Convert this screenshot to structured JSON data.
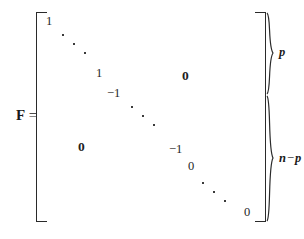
{
  "figure": {
    "type": "matrix-equation",
    "lhs": {
      "symbol": "F",
      "equals": "="
    },
    "matrix": {
      "bracket_style": "square",
      "diagonal_entries": [
        {
          "label": "1",
          "x": 10,
          "y": 3
        },
        {
          "label": "1",
          "x": 60,
          "y": 55
        },
        {
          "label": "−1",
          "x": 71,
          "y": 75
        },
        {
          "label": "−1",
          "x": 133,
          "y": 131
        },
        {
          "label": "0",
          "x": 152,
          "y": 148
        },
        {
          "label": "0",
          "x": 208,
          "y": 194
        }
      ],
      "diagonal_ellipses": [
        {
          "x": 26,
          "y": 22
        },
        {
          "x": 95,
          "y": 94
        },
        {
          "x": 166,
          "y": 170
        }
      ],
      "zero_blocks": [
        {
          "label": "0",
          "position": "upper-right",
          "x": 146,
          "y": 57
        },
        {
          "label": "0",
          "position": "lower-left",
          "x": 42,
          "y": 128
        }
      ]
    },
    "partitions": [
      {
        "name": "upper-block",
        "label_main": "p",
        "label_op": "",
        "label_tail": "",
        "top": 12,
        "height": 83
      },
      {
        "name": "lower-block",
        "label_main": "n",
        "label_op": "−",
        "label_tail": "p",
        "top": 95,
        "height": 127
      }
    ]
  },
  "colors": {
    "ink": "#1a1a1a",
    "background": "#ffffff"
  }
}
